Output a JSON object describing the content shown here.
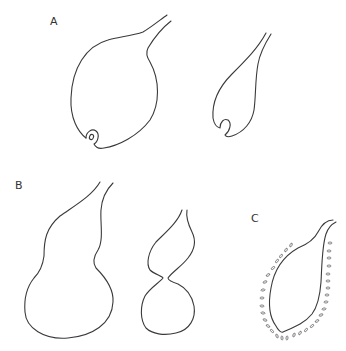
{
  "figure": {
    "panels": [
      {
        "id": "A",
        "label": "A",
        "description": "Flask-shaped structures with terminal curl",
        "shape_count": 2
      },
      {
        "id": "B",
        "label": "B",
        "description": "Constricted gourd-shaped structures",
        "shape_count": 2
      },
      {
        "id": "C",
        "label": "C",
        "description": "Flask-shaped structure surrounded by small oval bodies",
        "shape_count": 1
      }
    ],
    "colors": {
      "stroke": "#3a3a3a",
      "background": "#ffffff"
    }
  }
}
